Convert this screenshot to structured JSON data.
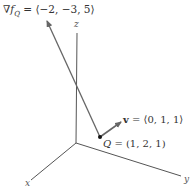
{
  "diagram": {
    "type": "3d-vector-diagram",
    "axes": {
      "x_label": "x",
      "y_label": "y",
      "z_label": "z"
    },
    "gradient": {
      "symbol": "∇f",
      "subscript": "Q",
      "equals": " = ",
      "value": "⟨−2, −3, 5⟩"
    },
    "direction_vector": {
      "symbol": "v",
      "equals": " = ",
      "value": "⟨0, 1, 1⟩"
    },
    "point": {
      "name": "Q",
      "equals": " = ",
      "value": "(1, 2, 1)"
    },
    "colors": {
      "axis": "#666666",
      "vector": "#666666",
      "point": "#111111",
      "text": "#333333"
    }
  }
}
